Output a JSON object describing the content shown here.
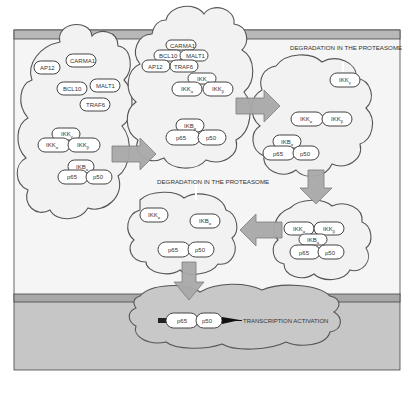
{
  "colors": {
    "cytoplasm": "#f4f4f4",
    "membrane": "#b5b5b5",
    "nucleus": "#c4c4c4",
    "arrow": "#a9a9a9",
    "outline": "#555555"
  },
  "labels": {
    "degradation_top": "DEGRADATION IN THE PROTEASOME",
    "degradation_mid": "DEGRADATION IN THE PROTEASOME",
    "transcription": "TRANSCRIPTION ACTIVATION"
  },
  "complexes": {
    "c1": {
      "ap12": "AP12",
      "carma1": "CARMA1",
      "bcl10": "BCL10",
      "malt1": "MALT1",
      "traf6": "TRAF6",
      "ikk": "IKK",
      "ikk_sub": "γ",
      "ikka": "IKK",
      "ikka_sub": "α",
      "ikkb": "IKK",
      "ikkb_sub": "β",
      "ikb": "IKB",
      "ikb_sub": "α",
      "p65": "p65",
      "p50": "p50"
    },
    "c2": {
      "carma1": "CARMA1",
      "bcl10": "BCL10",
      "malt1": "MALT1",
      "ap12": "AP12",
      "traf6": "TRAF6",
      "ikk": "IKK",
      "ikk_sub": "γ",
      "ikka": "IKK",
      "ikka_sub": "α",
      "ikkb": "IKK",
      "ikkb_sub": "β",
      "ikb": "IKB",
      "ikb_sub": "α",
      "p65": "p65",
      "p50": "p50"
    },
    "c3": {
      "ikk": "IKK",
      "ikk_sub": "γ",
      "ikka": "IKK",
      "ikka_sub": "α",
      "ikkb": "IKK",
      "ikkb_sub": "β",
      "ikb": "IKB",
      "ikb_sub": "α",
      "p65": "p65",
      "p50": "p50"
    },
    "c4": {
      "ikka": "IKK",
      "ikka_sub": "α",
      "ikkb": "IKK",
      "ikkb_sub": "β",
      "ikb": "IKB",
      "ikb_sub": "α",
      "p65": "p65",
      "p50": "p50"
    },
    "c5": {
      "ikka": "IKK",
      "ikka_sub": "α",
      "ikb": "IKB",
      "ikb_sub": "α",
      "p65": "p65",
      "p50": "p50"
    },
    "nucleus": {
      "p65": "p65",
      "p50": "p50"
    }
  }
}
